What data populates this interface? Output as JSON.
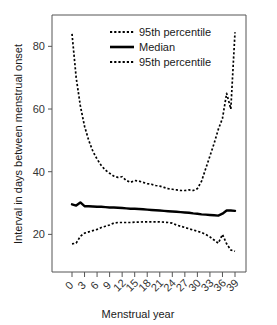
{
  "chart_data": {
    "type": "line",
    "title": "",
    "xlabel": "Menstrual year",
    "ylabel": "Interval in days between menstrual onset",
    "xlim": [
      0,
      39
    ],
    "ylim": [
      8,
      90
    ],
    "grid": false,
    "legend_position": "top-center",
    "x_tick_labels": [
      "0",
      "3",
      "6",
      "9",
      "12",
      "15",
      "18",
      "21",
      "24",
      "27",
      "30",
      "33",
      "36",
      "39"
    ],
    "x_tick_values": [
      0,
      3,
      6,
      9,
      12,
      15,
      18,
      21,
      24,
      27,
      30,
      33,
      36,
      39
    ],
    "y_tick_labels": [
      "20",
      "40",
      "60",
      "80"
    ],
    "y_tick_values": [
      20,
      40,
      60,
      80
    ],
    "x": [
      0,
      1,
      2,
      3,
      4,
      5,
      6,
      7,
      8,
      9,
      10,
      11,
      12,
      13,
      14,
      15,
      16,
      17,
      18,
      19,
      20,
      21,
      22,
      23,
      24,
      25,
      26,
      27,
      28,
      29,
      30,
      31,
      32,
      33,
      34,
      35,
      36,
      37,
      38,
      39
    ],
    "series": [
      {
        "name": "95th percentile",
        "style": "dashed",
        "position": "upper",
        "values": [
          84.0,
          70.0,
          61.0,
          54.5,
          50.0,
          46.5,
          44.0,
          42.0,
          40.5,
          39.5,
          38.6,
          38.2,
          38.4,
          37.2,
          36.6,
          37.2,
          37.0,
          36.6,
          36.2,
          36.0,
          35.6,
          35.4,
          35.0,
          34.6,
          34.4,
          34.2,
          34.0,
          34.0,
          34.2,
          34.0,
          34.6,
          37.0,
          41.0,
          45.0,
          49.0,
          53.5,
          57.0,
          65.0,
          60.0,
          84.5
        ]
      },
      {
        "name": "Median",
        "style": "solid",
        "position": "middle",
        "values": [
          29.6,
          29.2,
          30.2,
          29.0,
          29.0,
          28.9,
          28.8,
          28.8,
          28.7,
          28.6,
          28.6,
          28.5,
          28.4,
          28.3,
          28.2,
          28.2,
          28.1,
          28.0,
          27.9,
          27.8,
          27.7,
          27.6,
          27.5,
          27.4,
          27.3,
          27.2,
          27.1,
          27.0,
          26.9,
          26.7,
          26.6,
          26.4,
          26.3,
          26.2,
          26.1,
          26.0,
          26.6,
          27.6,
          27.6,
          27.5
        ]
      },
      {
        "name": "95th percentile",
        "style": "dashed",
        "position": "lower",
        "values": [
          17.0,
          17.2,
          19.4,
          20.4,
          20.8,
          21.2,
          21.6,
          22.2,
          22.6,
          23.0,
          23.6,
          23.8,
          23.8,
          23.8,
          23.8,
          23.9,
          23.9,
          24.0,
          24.0,
          24.0,
          24.0,
          24.0,
          23.9,
          23.8,
          23.6,
          23.0,
          22.6,
          22.2,
          21.8,
          21.4,
          21.0,
          20.6,
          20.0,
          19.2,
          18.2,
          17.2,
          20.0,
          17.0,
          15.0,
          14.6
        ]
      }
    ],
    "legend": [
      {
        "label": "95th percentile",
        "style": "dashed"
      },
      {
        "label": "Median",
        "style": "solid"
      },
      {
        "label": "95th percentile",
        "style": "dashed"
      }
    ],
    "colors": {
      "line": "#000000",
      "axis": "#555555",
      "text": "#1a1a1a",
      "background": "#ffffff"
    }
  }
}
